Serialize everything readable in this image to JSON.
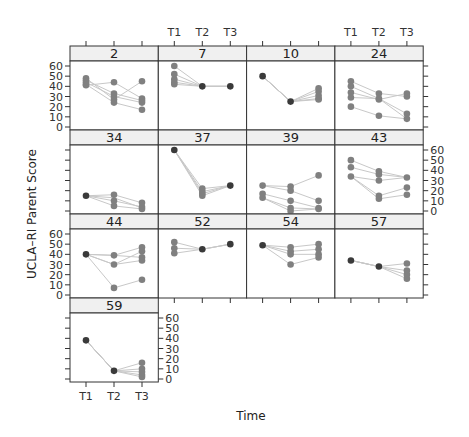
{
  "chart_data": {
    "type": "line",
    "layout": "lattice / trellis (4 columns x 4 rows), panels per participant ID",
    "xlabel": "Time",
    "ylabel": "UCLA–RI Parent Score",
    "x_ticks": [
      "T1",
      "T2",
      "T3"
    ],
    "y_ticks": [
      0,
      10,
      20,
      30,
      40,
      50,
      60
    ],
    "ylim": [
      0,
      60
    ],
    "colors": {
      "point_single": "#3a3a3a",
      "point_multi": "#808080",
      "line": "#c8c8c8",
      "strip_bg": "#f0f0f0",
      "border": "#333333"
    },
    "panels": [
      {
        "id": "2",
        "row": 0,
        "col": 0,
        "series": {
          "T1": [
            48,
            46,
            44,
            42,
            41
          ],
          "T2": [
            44,
            33,
            30,
            27,
            24
          ],
          "T3": [
            45,
            28,
            26,
            24,
            17
          ]
        },
        "lines": [
          [
            41,
            44,
            28
          ],
          [
            44,
            30,
            24
          ],
          [
            46,
            33,
            26
          ],
          [
            48,
            27,
            45
          ],
          [
            42,
            24,
            17
          ]
        ]
      },
      {
        "id": "7",
        "row": 0,
        "col": 1,
        "series": {
          "T1": [
            60,
            52,
            47,
            44,
            42
          ],
          "T2": [
            40
          ],
          "T3": [
            40
          ]
        },
        "lines": [
          [
            60,
            40,
            40
          ],
          [
            52,
            40,
            40
          ],
          [
            47,
            40,
            40
          ],
          [
            44,
            40,
            40
          ],
          [
            42,
            40,
            40
          ]
        ]
      },
      {
        "id": "10",
        "row": 0,
        "col": 2,
        "series": {
          "T1": [
            50
          ],
          "T2": [
            25
          ],
          "T3": [
            38,
            35,
            31,
            28,
            27
          ]
        },
        "lines": [
          [
            50,
            25,
            38
          ],
          [
            50,
            25,
            35
          ],
          [
            50,
            25,
            31
          ],
          [
            50,
            25,
            28
          ],
          [
            50,
            25,
            27
          ]
        ]
      },
      {
        "id": "24",
        "row": 0,
        "col": 3,
        "series": {
          "T1": [
            45,
            40,
            34,
            29,
            20
          ],
          "T2": [
            33,
            28,
            27,
            11
          ],
          "T3": [
            33,
            30,
            13,
            8
          ]
        },
        "lines": [
          [
            45,
            33,
            30
          ],
          [
            40,
            28,
            8
          ],
          [
            34,
            27,
            33
          ],
          [
            29,
            28,
            13
          ],
          [
            20,
            11,
            8
          ]
        ]
      },
      {
        "id": "34",
        "row": 1,
        "col": 0,
        "series": {
          "T1": [
            15
          ],
          "T2": [
            16,
            10,
            5
          ],
          "T3": [
            8,
            4,
            2
          ]
        },
        "lines": [
          [
            15,
            16,
            8
          ],
          [
            15,
            10,
            4
          ],
          [
            15,
            5,
            2
          ],
          [
            15,
            13,
            3
          ]
        ]
      },
      {
        "id": "37",
        "row": 1,
        "col": 1,
        "series": {
          "T1": [
            60
          ],
          "T2": [
            22,
            19,
            17,
            15
          ],
          "T3": [
            25
          ]
        },
        "lines": [
          [
            60,
            22,
            25
          ],
          [
            60,
            19,
            25
          ],
          [
            60,
            17,
            25
          ],
          [
            60,
            15,
            25
          ]
        ]
      },
      {
        "id": "39",
        "row": 1,
        "col": 2,
        "series": {
          "T1": [
            25,
            17,
            13
          ],
          "T2": [
            24,
            20,
            10,
            3,
            0
          ],
          "T3": [
            35,
            10,
            3,
            2
          ]
        },
        "lines": [
          [
            25,
            24,
            35
          ],
          [
            25,
            20,
            10
          ],
          [
            17,
            10,
            3
          ],
          [
            13,
            3,
            2
          ],
          [
            13,
            0,
            2
          ]
        ]
      },
      {
        "id": "43",
        "row": 1,
        "col": 3,
        "series": {
          "T1": [
            50,
            43,
            34
          ],
          "T2": [
            39,
            36,
            30,
            15,
            12
          ],
          "T3": [
            33,
            23,
            16
          ]
        },
        "lines": [
          [
            50,
            39,
            33
          ],
          [
            43,
            36,
            33
          ],
          [
            34,
            30,
            33
          ],
          [
            34,
            15,
            23
          ],
          [
            34,
            12,
            16
          ]
        ]
      },
      {
        "id": "44",
        "row": 2,
        "col": 0,
        "series": {
          "T1": [
            40
          ],
          "T2": [
            39,
            30,
            7
          ],
          "T3": [
            47,
            43,
            37,
            34,
            15
          ]
        },
        "lines": [
          [
            40,
            39,
            47
          ],
          [
            40,
            30,
            43
          ],
          [
            40,
            39,
            37
          ],
          [
            40,
            30,
            34
          ],
          [
            40,
            7,
            15
          ]
        ]
      },
      {
        "id": "52",
        "row": 2,
        "col": 1,
        "series": {
          "T1": [
            52,
            46,
            41
          ],
          "T2": [
            45
          ],
          "T3": [
            50
          ]
        },
        "lines": [
          [
            52,
            45,
            50
          ],
          [
            46,
            45,
            50
          ],
          [
            41,
            45,
            50
          ]
        ]
      },
      {
        "id": "54",
        "row": 2,
        "col": 2,
        "series": {
          "T1": [
            49
          ],
          "T2": [
            47,
            43,
            40,
            30
          ],
          "T3": [
            50,
            45,
            40,
            37
          ]
        },
        "lines": [
          [
            49,
            47,
            50
          ],
          [
            49,
            43,
            45
          ],
          [
            49,
            40,
            40
          ],
          [
            49,
            30,
            37
          ]
        ]
      },
      {
        "id": "57",
        "row": 2,
        "col": 3,
        "series": {
          "T1": [
            34
          ],
          "T2": [
            28
          ],
          "T3": [
            31,
            24,
            20,
            16
          ]
        },
        "lines": [
          [
            34,
            28,
            31
          ],
          [
            34,
            28,
            24
          ],
          [
            34,
            28,
            20
          ],
          [
            34,
            28,
            16
          ]
        ]
      },
      {
        "id": "59",
        "row": 3,
        "col": 0,
        "series": {
          "T1": [
            38
          ],
          "T2": [
            8
          ],
          "T3": [
            16,
            10,
            7,
            4,
            2
          ]
        },
        "lines": [
          [
            38,
            8,
            16
          ],
          [
            38,
            8,
            10
          ],
          [
            38,
            8,
            7
          ],
          [
            38,
            8,
            4
          ],
          [
            38,
            8,
            2
          ]
        ]
      }
    ]
  }
}
